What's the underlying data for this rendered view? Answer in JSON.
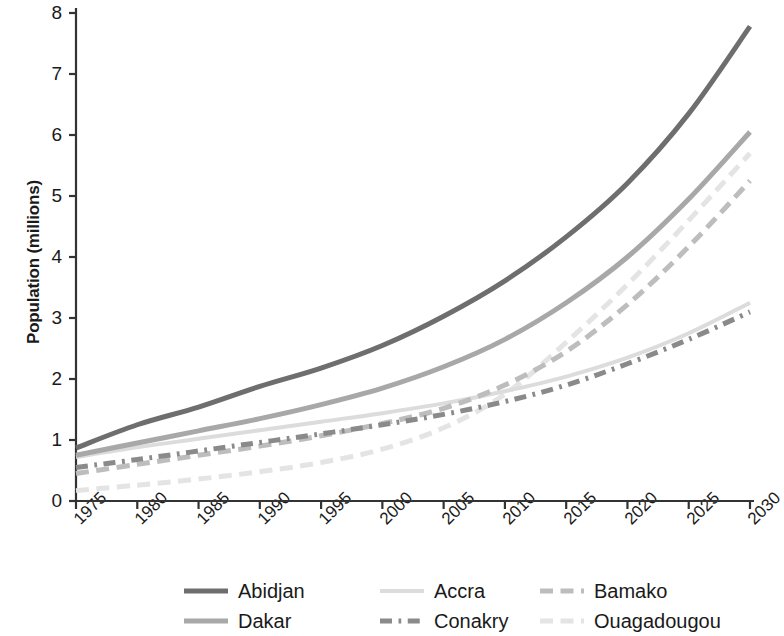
{
  "chart_data": {
    "type": "line",
    "title": "",
    "xlabel": "",
    "ylabel": "Population (millions)",
    "xlim": [
      1975,
      2030
    ],
    "ylim": [
      0,
      8
    ],
    "grid": false,
    "legend_position": "bottom",
    "x": [
      1975,
      1980,
      1985,
      1990,
      1995,
      2000,
      2005,
      2010,
      2015,
      2020,
      2025,
      2030
    ],
    "xticklabels": [
      "1975",
      "1980",
      "1985",
      "1990",
      "1995",
      "2000",
      "2005",
      "2010",
      "2015",
      "2020",
      "2025",
      "2030"
    ],
    "yticklabels": [
      "0",
      "1",
      "2",
      "3",
      "4",
      "5",
      "6",
      "7",
      "8"
    ],
    "yticks": [
      0,
      1,
      2,
      3,
      4,
      5,
      6,
      7,
      8
    ],
    "series": [
      {
        "name": "Abidjan",
        "color": "#6e6e6e",
        "style": "solid",
        "width": 5,
        "values": [
          0.87,
          1.25,
          1.54,
          1.88,
          2.18,
          2.55,
          3.03,
          3.61,
          4.33,
          5.21,
          6.35,
          7.78
        ]
      },
      {
        "name": "Accra",
        "color": "#dcdcdc",
        "style": "solid",
        "width": 4,
        "values": [
          0.72,
          0.88,
          1.02,
          1.16,
          1.3,
          1.44,
          1.6,
          1.8,
          2.04,
          2.35,
          2.75,
          3.25
        ]
      },
      {
        "name": "Bamako",
        "color": "#bdbdbd",
        "style": "dashed",
        "width": 5,
        "values": [
          0.45,
          0.6,
          0.75,
          0.9,
          1.07,
          1.27,
          1.52,
          1.9,
          2.45,
          3.22,
          4.17,
          5.25
        ]
      },
      {
        "name": "Dakar",
        "color": "#a8a8a8",
        "style": "solid",
        "width": 5,
        "values": [
          0.75,
          0.95,
          1.15,
          1.35,
          1.58,
          1.85,
          2.2,
          2.65,
          3.25,
          4.0,
          4.95,
          6.05
        ]
      },
      {
        "name": "Conakry",
        "color": "#8a8a8a",
        "style": "dashdot",
        "width": 5,
        "values": [
          0.55,
          0.68,
          0.82,
          0.96,
          1.1,
          1.25,
          1.42,
          1.63,
          1.9,
          2.25,
          2.65,
          3.1
        ]
      },
      {
        "name": "Ouagadougou",
        "color": "#e4e4e4",
        "style": "dashed",
        "width": 5,
        "values": [
          0.17,
          0.26,
          0.36,
          0.48,
          0.63,
          0.85,
          1.2,
          1.75,
          2.6,
          3.55,
          4.6,
          5.7
        ]
      }
    ]
  },
  "legend": {
    "rows": [
      [
        "Abidjan",
        "Accra",
        "Bamako"
      ],
      [
        "Dakar",
        "Conakry",
        "Ouagadougou"
      ]
    ]
  },
  "axis": {
    "color": "#333333"
  }
}
